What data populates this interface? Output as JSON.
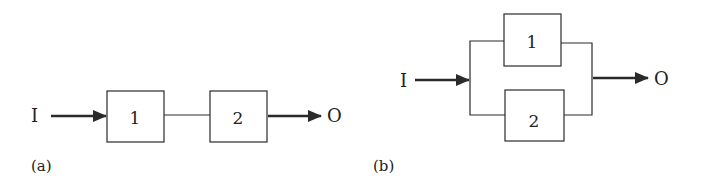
{
  "panel_a": {
    "label": "(a)",
    "input": "I",
    "output": "O",
    "blocks": [
      "1",
      "2"
    ],
    "configuration": "series"
  },
  "panel_b": {
    "label": "(b)",
    "input": "I",
    "output": "O",
    "blocks": [
      "1",
      "2"
    ],
    "configuration": "parallel"
  },
  "colors": {
    "line": "#2a2a2a",
    "background": "#ffffff"
  }
}
